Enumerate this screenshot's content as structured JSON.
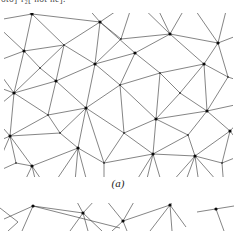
{
  "page": {
    "clipped_text": "oto]·r₂[ not ne].",
    "caption_a": "(a)"
  },
  "colors": {
    "line": "#333333",
    "dot": "#0a0a0a",
    "background": "#ffffff",
    "text": "#4a4a4a"
  },
  "figure_a": {
    "description": "triangulated-net",
    "nodes": [
      {
        "id": "h1",
        "x": 28,
        "y": 1,
        "hub": true
      },
      {
        "id": "h2",
        "x": 96,
        "y": 9,
        "hub": true
      },
      {
        "id": "h3",
        "x": 166,
        "y": 21,
        "hub": true
      },
      {
        "id": "h4",
        "x": 214,
        "y": 30,
        "hub": true
      },
      {
        "id": "h5",
        "x": 20,
        "y": 38,
        "hub": true
      },
      {
        "id": "h6",
        "x": 91,
        "y": 51,
        "hub": true
      },
      {
        "id": "h7",
        "x": 131,
        "y": 40,
        "hub": true
      },
      {
        "id": "h8",
        "x": 200,
        "y": 51,
        "hub": true
      },
      {
        "id": "h9",
        "x": 52,
        "y": 68,
        "hub": true
      },
      {
        "id": "h10",
        "x": 10,
        "y": 80,
        "hub": true
      },
      {
        "id": "h11",
        "x": 82,
        "y": 95,
        "hub": true
      },
      {
        "id": "h12",
        "x": 152,
        "y": 106,
        "hub": true
      },
      {
        "id": "h13",
        "x": 203,
        "y": 98,
        "hub": true
      },
      {
        "id": "h14",
        "x": 6,
        "y": 123,
        "hub": true
      },
      {
        "id": "h15",
        "x": 74,
        "y": 135,
        "hub": true
      },
      {
        "id": "h16",
        "x": 28,
        "y": 153,
        "hub": true
      },
      {
        "id": "h17",
        "x": 149,
        "y": 141,
        "hub": true
      },
      {
        "id": "h18",
        "x": 191,
        "y": 143,
        "hub": true
      },
      {
        "id": "h19",
        "x": 226,
        "y": 118,
        "hub": true
      },
      {
        "id": "n1",
        "x": 60,
        "y": 32,
        "hub": false
      },
      {
        "id": "n2",
        "x": 117,
        "y": 26,
        "hub": false
      },
      {
        "id": "n3",
        "x": 156,
        "y": 60,
        "hub": false
      },
      {
        "id": "n4",
        "x": 224,
        "y": 64,
        "hub": false
      },
      {
        "id": "n5",
        "x": 36,
        "y": 55,
        "hub": false
      },
      {
        "id": "n6",
        "x": 116,
        "y": 72,
        "hub": false
      },
      {
        "id": "n7",
        "x": 176,
        "y": 80,
        "hub": false
      },
      {
        "id": "n8",
        "x": 44,
        "y": 102,
        "hub": false
      },
      {
        "id": "n9",
        "x": 120,
        "y": 120,
        "hub": false
      },
      {
        "id": "n10",
        "x": 184,
        "y": 122,
        "hub": false
      },
      {
        "id": "n11",
        "x": 100,
        "y": 150,
        "hub": false
      },
      {
        "id": "n12",
        "x": 56,
        "y": 120,
        "hub": false
      },
      {
        "id": "n13",
        "x": 218,
        "y": 150,
        "hub": false
      },
      {
        "id": "n14",
        "x": 12,
        "y": 150,
        "hub": false
      },
      {
        "id": "o1",
        "x": -12,
        "y": 8,
        "hub": false
      },
      {
        "id": "o2",
        "x": 30,
        "y": -12,
        "hub": false
      },
      {
        "id": "o3",
        "x": 75,
        "y": -15,
        "hub": false
      },
      {
        "id": "o4",
        "x": 130,
        "y": -14,
        "hub": false
      },
      {
        "id": "o5",
        "x": 185,
        "y": -12,
        "hub": false
      },
      {
        "id": "o6",
        "x": 225,
        "y": -14,
        "hub": false
      },
      {
        "id": "o7",
        "x": 240,
        "y": 20,
        "hub": false
      },
      {
        "id": "o8",
        "x": 242,
        "y": 70,
        "hub": false
      },
      {
        "id": "o9",
        "x": 243,
        "y": 140,
        "hub": false
      },
      {
        "id": "o10",
        "x": 220,
        "y": 176,
        "hub": false
      },
      {
        "id": "o11",
        "x": 160,
        "y": 178,
        "hub": false
      },
      {
        "id": "o12",
        "x": 100,
        "y": 180,
        "hub": false
      },
      {
        "id": "o13",
        "x": 45,
        "y": 178,
        "hub": false
      },
      {
        "id": "o14",
        "x": -10,
        "y": 160,
        "hub": false
      },
      {
        "id": "o15",
        "x": -14,
        "y": 100,
        "hub": false
      },
      {
        "id": "o16",
        "x": -12,
        "y": 50,
        "hub": false
      },
      {
        "id": "o17",
        "x": 5,
        "y": -10,
        "hub": false
      },
      {
        "id": "o18",
        "x": 238,
        "y": 105,
        "hub": false
      },
      {
        "id": "o19",
        "x": -10,
        "y": 130,
        "hub": false
      },
      {
        "id": "o20",
        "x": 140,
        "y": 178,
        "hub": false
      },
      {
        "id": "o21",
        "x": 240,
        "y": 90,
        "hub": false
      },
      {
        "id": "o22",
        "x": 150,
        "y": -12,
        "hub": false
      },
      {
        "id": "o23",
        "x": 16,
        "y": 178,
        "hub": false
      },
      {
        "id": "o24",
        "x": 34,
        "y": 178,
        "hub": false
      },
      {
        "id": "o25",
        "x": 70,
        "y": 180,
        "hub": false
      },
      {
        "id": "o26",
        "x": 86,
        "y": 180,
        "hub": false
      },
      {
        "id": "o27",
        "x": 126,
        "y": 178,
        "hub": false
      },
      {
        "id": "o28",
        "x": 196,
        "y": 178,
        "hub": false
      },
      {
        "id": "o29",
        "x": 178,
        "y": 178,
        "hub": false
      },
      {
        "id": "o30",
        "x": -12,
        "y": 72,
        "hub": false
      }
    ],
    "edges": [
      [
        "h1",
        "o17"
      ],
      [
        "h1",
        "o2"
      ],
      [
        "h1",
        "o1"
      ],
      [
        "h1",
        "n1"
      ],
      [
        "h1",
        "h5"
      ],
      [
        "h1",
        "h2"
      ],
      [
        "h2",
        "o3"
      ],
      [
        "h2",
        "o4"
      ],
      [
        "h2",
        "n1"
      ],
      [
        "h2",
        "n2"
      ],
      [
        "h2",
        "h6"
      ],
      [
        "h2",
        "h7"
      ],
      [
        "h3",
        "o4"
      ],
      [
        "h3",
        "o5"
      ],
      [
        "h3",
        "o22"
      ],
      [
        "h3",
        "n2"
      ],
      [
        "h3",
        "h7"
      ],
      [
        "h3",
        "h8"
      ],
      [
        "h3",
        "h4"
      ],
      [
        "h4",
        "o5"
      ],
      [
        "h4",
        "o6"
      ],
      [
        "h4",
        "o7"
      ],
      [
        "h4",
        "h8"
      ],
      [
        "h4",
        "n4"
      ],
      [
        "h5",
        "o1"
      ],
      [
        "h5",
        "o16"
      ],
      [
        "h5",
        "n1"
      ],
      [
        "h5",
        "n5"
      ],
      [
        "h5",
        "h10"
      ],
      [
        "h6",
        "n1"
      ],
      [
        "h6",
        "h9"
      ],
      [
        "h6",
        "h11"
      ],
      [
        "h6",
        "n6"
      ],
      [
        "h6",
        "h7"
      ],
      [
        "h6",
        "n2"
      ],
      [
        "h7",
        "n3"
      ],
      [
        "h7",
        "n6"
      ],
      [
        "h8",
        "n3"
      ],
      [
        "h8",
        "n4"
      ],
      [
        "h8",
        "h13"
      ],
      [
        "h8",
        "n7"
      ],
      [
        "h9",
        "n1"
      ],
      [
        "h9",
        "n5"
      ],
      [
        "h9",
        "h10"
      ],
      [
        "h9",
        "h11"
      ],
      [
        "h9",
        "n8"
      ],
      [
        "h10",
        "o16"
      ],
      [
        "h10",
        "o15"
      ],
      [
        "h10",
        "o30"
      ],
      [
        "h10",
        "n8"
      ],
      [
        "h10",
        "h14"
      ],
      [
        "h10",
        "n5"
      ],
      [
        "h11",
        "n6"
      ],
      [
        "h11",
        "n9"
      ],
      [
        "h11",
        "n12"
      ],
      [
        "h11",
        "n8"
      ],
      [
        "h11",
        "h15"
      ],
      [
        "h11",
        "n11"
      ],
      [
        "h12",
        "n6"
      ],
      [
        "h12",
        "n3"
      ],
      [
        "h12",
        "n7"
      ],
      [
        "h12",
        "h13"
      ],
      [
        "h12",
        "n10"
      ],
      [
        "h12",
        "h17"
      ],
      [
        "h12",
        "n9"
      ],
      [
        "h13",
        "n7"
      ],
      [
        "h13",
        "n4"
      ],
      [
        "h13",
        "h19"
      ],
      [
        "h13",
        "n10"
      ],
      [
        "h13",
        "o21"
      ],
      [
        "h14",
        "o19"
      ],
      [
        "h14",
        "o15"
      ],
      [
        "h14",
        "n8"
      ],
      [
        "h14",
        "h16"
      ],
      [
        "h14",
        "o14"
      ],
      [
        "h14",
        "n12"
      ],
      [
        "h14",
        "n14"
      ],
      [
        "h15",
        "n12"
      ],
      [
        "h15",
        "n11"
      ],
      [
        "h15",
        "h16"
      ],
      [
        "h15",
        "o13"
      ],
      [
        "h15",
        "o25"
      ],
      [
        "h15",
        "o26"
      ],
      [
        "h16",
        "n14"
      ],
      [
        "h16",
        "o13"
      ],
      [
        "h16",
        "o23"
      ],
      [
        "h16",
        "o24"
      ],
      [
        "h17",
        "n9"
      ],
      [
        "h17",
        "n11"
      ],
      [
        "h17",
        "h18"
      ],
      [
        "h17",
        "o11"
      ],
      [
        "h17",
        "o20"
      ],
      [
        "h17",
        "o27"
      ],
      [
        "h17",
        "n10"
      ],
      [
        "h18",
        "n10"
      ],
      [
        "h18",
        "h19"
      ],
      [
        "h18",
        "n13"
      ],
      [
        "h18",
        "o10"
      ],
      [
        "h18",
        "o11"
      ],
      [
        "h18",
        "o28"
      ],
      [
        "h18",
        "o29"
      ],
      [
        "h19",
        "n13"
      ],
      [
        "h19",
        "o18"
      ],
      [
        "h19",
        "o9"
      ],
      [
        "n1",
        "n5"
      ],
      [
        "n2",
        "o4"
      ],
      [
        "n3",
        "n7"
      ],
      [
        "n3",
        "n6"
      ],
      [
        "n4",
        "o8"
      ],
      [
        "n6",
        "n9"
      ],
      [
        "n8",
        "n12"
      ],
      [
        "n9",
        "n11"
      ],
      [
        "n11",
        "o12"
      ],
      [
        "n13",
        "o10"
      ],
      [
        "n13",
        "o9"
      ],
      [
        "n14",
        "o14"
      ]
    ]
  },
  "figure_b": {
    "description": "second-net-top-sliver",
    "dots": [
      [
        33,
        3
      ],
      [
        83,
        10
      ],
      [
        123,
        18
      ],
      [
        170,
        2
      ],
      [
        216,
        6
      ]
    ],
    "segments": [
      [
        33,
        3,
        4,
        16
      ],
      [
        33,
        3,
        22,
        28
      ],
      [
        33,
        3,
        83,
        10
      ],
      [
        33,
        3,
        120,
        25
      ],
      [
        0,
        5,
        18,
        19
      ],
      [
        18,
        19,
        8,
        28
      ],
      [
        83,
        10,
        76,
        -3
      ],
      [
        83,
        10,
        95,
        -3
      ],
      [
        83,
        10,
        70,
        28
      ],
      [
        83,
        10,
        88,
        28
      ],
      [
        83,
        10,
        102,
        28
      ],
      [
        123,
        18,
        106,
        -3
      ],
      [
        123,
        18,
        135,
        -3
      ],
      [
        123,
        18,
        112,
        28
      ],
      [
        123,
        18,
        127,
        28
      ],
      [
        123,
        18,
        170,
        2
      ],
      [
        170,
        2,
        150,
        28
      ],
      [
        170,
        2,
        172,
        28
      ],
      [
        170,
        2,
        186,
        24
      ],
      [
        170,
        2,
        174,
        -3
      ],
      [
        197,
        9,
        234,
        3
      ],
      [
        216,
        6,
        224,
        28
      ]
    ]
  }
}
